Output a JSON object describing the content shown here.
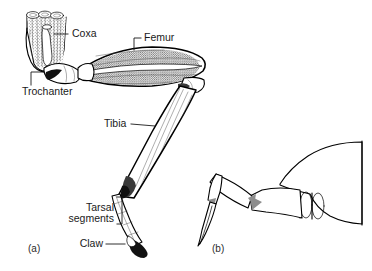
{
  "figure": {
    "background_color": "#ffffff",
    "ink_color": "#000000"
  },
  "panels": [
    {
      "id": "a",
      "label": "(a)",
      "label_x": 28,
      "label_y": 249,
      "description": "Detailed dissected insect hind leg showing internal musculature"
    },
    {
      "id": "b",
      "label": "(b)",
      "label_x": 212,
      "label_y": 249,
      "description": "Simplified outline of insect leg attached to body"
    }
  ],
  "labels": [
    {
      "id": "coxa",
      "text": "Coxa",
      "x": 72,
      "y": 34,
      "anchor": "start",
      "leader": "M 68 34 L 54 34"
    },
    {
      "id": "femur",
      "text": "Femur",
      "x": 144,
      "y": 38,
      "anchor": "start",
      "leader": "M 141 38 L 134 38 L 134 50"
    },
    {
      "id": "trochanter",
      "text": "Trochanter",
      "x": 22,
      "y": 92,
      "anchor": "start",
      "leader": "M 31 85 L 31 72 L 44 72"
    },
    {
      "id": "tibia",
      "text": "Tibia",
      "x": 104,
      "y": 124,
      "anchor": "start",
      "leader": "M 130 124 L 152 124"
    },
    {
      "id": "tarsal-segments",
      "text": "Tarsal",
      "text2": "segments",
      "x": 72,
      "y": 208,
      "y2": 219,
      "anchor": "start",
      "leader": "M 118 198 L 123 198 L 123 224 L 118 224"
    },
    {
      "id": "claw",
      "text": "Claw",
      "x": 78,
      "y": 244,
      "anchor": "start",
      "leader": "M 105 244 L 124 244"
    }
  ],
  "colors": {
    "outline": "#000000",
    "label_text": "#1a1a1a",
    "claw_fill": "#111111",
    "joint_shade": "#8e8e8e",
    "muscle_shade": "#c9c9c9",
    "background": "#ffffff"
  }
}
